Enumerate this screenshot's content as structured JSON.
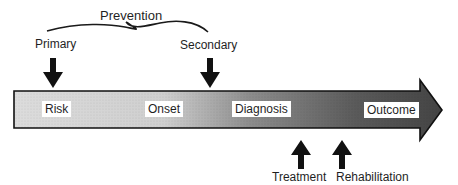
{
  "diagram": {
    "prevention_label": "Prevention",
    "top_labels": {
      "primary": "Primary",
      "secondary": "Secondary"
    },
    "stages": [
      {
        "label": "Risk"
      },
      {
        "label": "Onset"
      },
      {
        "label": "Diagnosis"
      },
      {
        "label": "Outcome"
      }
    ],
    "bottom_labels": {
      "treatment": "Treatment",
      "rehabilitation": "Rehabilitation"
    },
    "colors": {
      "arrow_light": "#d8d8d8",
      "arrow_mid": "#9a9a9a",
      "arrow_dark": "#3a3a3a",
      "outline": "#111111"
    }
  }
}
